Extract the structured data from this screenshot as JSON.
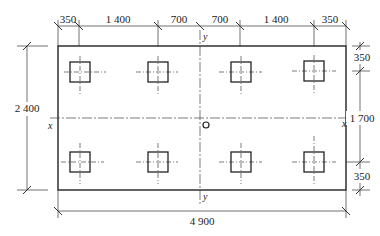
{
  "drawing": {
    "type": "pile cap foundation plan",
    "top_dimensions": [
      "350",
      "1 400",
      "700",
      "700",
      "1 400",
      "350"
    ],
    "bottom_dimension": "4 900",
    "left_dimension": "2 400",
    "right_dimensions": [
      "350",
      "1 700",
      "350"
    ],
    "axis_labels": {
      "x_left": "x",
      "x_right": "x",
      "y_top": "y",
      "y_bottom": "y"
    },
    "pile_count": 8,
    "origin_marker": "o",
    "colors": {
      "line": "#222222",
      "centerline": "#555555",
      "background": "#ffffff"
    }
  }
}
